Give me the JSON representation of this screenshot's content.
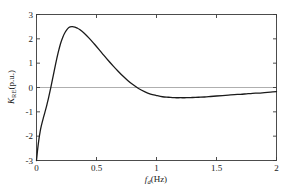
{
  "chart_data": {
    "type": "line",
    "title": "",
    "xlabel": "f_d(Hz)",
    "ylabel": "K_RE(p.u.)",
    "xlim": [
      0,
      2
    ],
    "ylim": [
      -3,
      3
    ],
    "grid": false,
    "legend": null,
    "zero_line": true,
    "xticks": [
      "0",
      "0.5",
      "1",
      "1.5",
      "2"
    ],
    "xtick_values": [
      0,
      0.5,
      1,
      1.5,
      2
    ],
    "yticks": [
      "3",
      "2",
      "1",
      "0",
      "-1",
      "-2",
      "-3"
    ],
    "ytick_values": [
      3,
      2,
      1,
      0,
      -1,
      -2,
      -3
    ],
    "series": [
      {
        "name": "K_RE",
        "color": "#1a1a1a",
        "line_width": 1.3,
        "x": [
          0.0,
          0.01,
          0.02,
          0.03,
          0.04,
          0.05,
          0.06,
          0.07,
          0.08,
          0.09,
          0.1,
          0.12,
          0.14,
          0.16,
          0.18,
          0.2,
          0.22,
          0.24,
          0.26,
          0.28,
          0.3,
          0.32,
          0.34,
          0.36,
          0.4,
          0.44,
          0.48,
          0.52,
          0.56,
          0.6,
          0.64,
          0.68,
          0.72,
          0.76,
          0.8,
          0.85,
          0.9,
          0.95,
          1.0,
          1.05,
          1.1,
          1.15,
          1.2,
          1.25,
          1.3,
          1.35,
          1.4,
          1.45,
          1.5,
          1.55,
          1.6,
          1.65,
          1.7,
          1.75,
          1.8,
          1.85,
          1.9,
          1.95,
          2.0
        ],
        "y": [
          -3.0,
          -2.52,
          -2.13,
          -1.82,
          -1.58,
          -1.38,
          -1.2,
          -1.02,
          -0.84,
          -0.64,
          -0.44,
          0.02,
          0.5,
          0.98,
          1.42,
          1.8,
          2.08,
          2.28,
          2.42,
          2.49,
          2.5,
          2.48,
          2.44,
          2.38,
          2.22,
          2.02,
          1.8,
          1.57,
          1.33,
          1.1,
          0.88,
          0.67,
          0.47,
          0.29,
          0.13,
          -0.04,
          -0.17,
          -0.27,
          -0.33,
          -0.38,
          -0.4,
          -0.42,
          -0.42,
          -0.42,
          -0.41,
          -0.4,
          -0.39,
          -0.37,
          -0.35,
          -0.33,
          -0.31,
          -0.29,
          -0.28,
          -0.26,
          -0.24,
          -0.23,
          -0.21,
          -0.19,
          -0.17
        ]
      }
    ]
  },
  "axes": {
    "x_title_main": "(Hz)",
    "x_title_var": "f",
    "x_title_sub": "d",
    "y_title_var": "K",
    "y_title_sub": "RE",
    "y_title_main": "(p.u.)"
  },
  "colors": {
    "curve": "#1a1a1a",
    "frame": "#3a3a3a",
    "zero_line": "#9a9a9a",
    "text": "#1a1a1a",
    "background": "#ffffff"
  }
}
